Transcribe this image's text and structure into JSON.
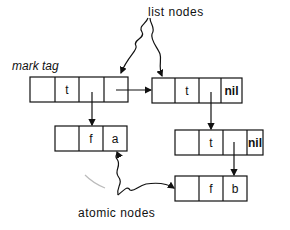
{
  "labels": {
    "list_nodes": "list nodes",
    "mark_tag": "mark  tag",
    "atomic_nodes": "atomic nodes"
  },
  "nodes": {
    "a": {
      "cells": [
        "",
        "t",
        "",
        ""
      ]
    },
    "b": {
      "cells": [
        "",
        "t",
        "",
        "nil"
      ]
    },
    "c": {
      "cells": [
        "",
        "f",
        "a"
      ]
    },
    "d": {
      "cells": [
        "",
        "t",
        "",
        "nil"
      ]
    },
    "e": {
      "cells": [
        "",
        "f",
        "b"
      ]
    }
  }
}
